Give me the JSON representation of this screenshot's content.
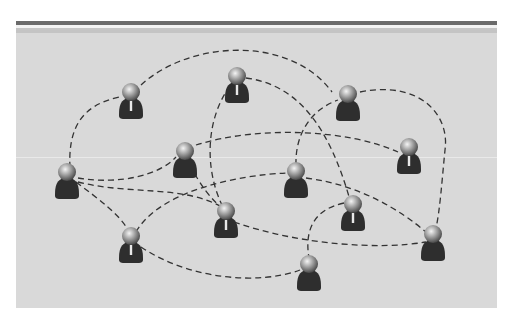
{
  "diagram": {
    "type": "social-network",
    "colors": {
      "background": "#d9d9d9",
      "top_bar": "#6a6a6a",
      "top_band": "#c4c4c4",
      "line": "#333333",
      "body": "#2e2e2e",
      "head_light": "#e8e8e8",
      "head_dark": "#5a5a5a"
    },
    "nodes": [
      {
        "id": "A",
        "x": 131,
        "y": 96,
        "tie": true
      },
      {
        "id": "B",
        "x": 237,
        "y": 80,
        "tie": true
      },
      {
        "id": "C",
        "x": 348,
        "y": 98,
        "tie": false
      },
      {
        "id": "D",
        "x": 409,
        "y": 151,
        "tie": true
      },
      {
        "id": "E",
        "x": 67,
        "y": 176,
        "tie": false
      },
      {
        "id": "F",
        "x": 185,
        "y": 155,
        "tie": false
      },
      {
        "id": "G",
        "x": 296,
        "y": 175,
        "tie": false
      },
      {
        "id": "H",
        "x": 226,
        "y": 215,
        "tie": true
      },
      {
        "id": "I",
        "x": 353,
        "y": 208,
        "tie": true
      },
      {
        "id": "J",
        "x": 131,
        "y": 240,
        "tie": true
      },
      {
        "id": "K",
        "x": 433,
        "y": 238,
        "tie": false
      },
      {
        "id": "L",
        "x": 309,
        "y": 268,
        "tie": false
      }
    ]
  }
}
